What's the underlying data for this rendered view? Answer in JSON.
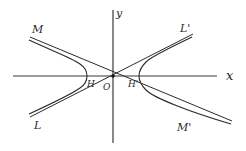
{
  "diagram": {
    "title": "",
    "colors": {
      "background": "#ffffff",
      "ink": "#2a2a2a",
      "axis": "#3a3a3a"
    },
    "origin": {
      "x": 113,
      "y": 76
    },
    "axes": {
      "x": {
        "label": "x",
        "from": 13,
        "to": 217
      },
      "y": {
        "label": "y",
        "from": 10,
        "to": 143
      }
    },
    "asymptotes": [
      {
        "name": "MM'",
        "start_label": "M",
        "end_label": "M'",
        "x1": 30,
        "y1": 37,
        "x2": 232,
        "y2": 121
      },
      {
        "name": "LL'",
        "start_label": "L",
        "end_label": "L'",
        "x1": 30,
        "y1": 117,
        "x2": 193,
        "y2": 34
      }
    ],
    "hyperbola": {
      "a": 26,
      "vertices": [
        {
          "label": "H",
          "x": 87,
          "y": 76
        },
        {
          "label": "H'",
          "x": 139,
          "y": 76
        }
      ]
    },
    "labels": {
      "M": "M",
      "L_prime": "L'",
      "L": "L",
      "M_prime": "M'",
      "H": "H",
      "O": "O",
      "H_prime": "H'",
      "x": "x",
      "y": "y"
    }
  }
}
